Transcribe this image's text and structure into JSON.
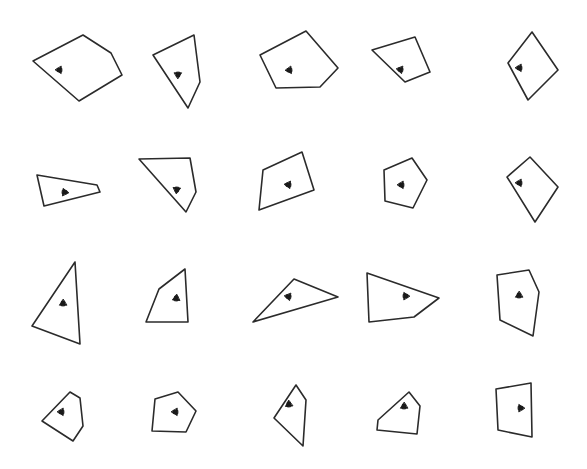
{
  "figure": {
    "background_color": "#ffffff",
    "stroke_color": "#2b2b2b",
    "marker_color": "#1a1a1a",
    "width": 587,
    "height": 469,
    "grid_rows": 4,
    "grid_columns": 5,
    "shape_count": 20
  },
  "chart_data": {
    "type": "scatter",
    "xlabel": "",
    "ylabel": "",
    "xlim": [
      0,
      587
    ],
    "ylim": [
      0,
      469
    ],
    "grid": false,
    "legend": null,
    "shapes": [
      {
        "id": "shape-r1c1",
        "row": 1,
        "column": 1,
        "sides": 5,
        "kind": "pentagon",
        "marker_direction": "left",
        "marker_angle_deg": 180,
        "marker_point": [
          61,
          70
        ],
        "vertices": [
          [
            33,
            61
          ],
          [
            83,
            35
          ],
          [
            111,
            53
          ],
          [
            122,
            75
          ],
          [
            79,
            101
          ]
        ]
      },
      {
        "id": "shape-r1c2",
        "row": 1,
        "column": 2,
        "sides": 4,
        "kind": "quadrilateral",
        "marker_direction": "down",
        "marker_angle_deg": 90,
        "marker_point": [
          178,
          73
        ],
        "vertices": [
          [
            153,
            55
          ],
          [
            194,
            35
          ],
          [
            200,
            82
          ],
          [
            188,
            108
          ]
        ]
      },
      {
        "id": "shape-r1c3",
        "row": 1,
        "column": 3,
        "sides": 5,
        "kind": "pentagon",
        "marker_direction": "left",
        "marker_angle_deg": 175,
        "marker_point": [
          291,
          70
        ],
        "vertices": [
          [
            260,
            55
          ],
          [
            306,
            31
          ],
          [
            338,
            68
          ],
          [
            320,
            87
          ],
          [
            276,
            88
          ]
        ]
      },
      {
        "id": "shape-r1c4",
        "row": 1,
        "column": 4,
        "sides": 4,
        "kind": "quadrilateral",
        "marker_direction": "left",
        "marker_angle_deg": 190,
        "marker_point": [
          402,
          70
        ],
        "vertices": [
          [
            372,
            50
          ],
          [
            415,
            37
          ],
          [
            430,
            72
          ],
          [
            405,
            82
          ]
        ]
      },
      {
        "id": "shape-r1c5",
        "row": 1,
        "column": 5,
        "sides": 4,
        "kind": "quadrilateral",
        "marker_direction": "left",
        "marker_angle_deg": 180,
        "marker_point": [
          521,
          68
        ],
        "vertices": [
          [
            508,
            63
          ],
          [
            532,
            32
          ],
          [
            558,
            70
          ],
          [
            528,
            100
          ]
        ]
      },
      {
        "id": "shape-r2c1",
        "row": 2,
        "column": 1,
        "sides": 4,
        "kind": "quadrilateral",
        "marker_direction": "right",
        "marker_angle_deg": 5,
        "marker_point": [
          63,
          192
        ],
        "vertices": [
          [
            37,
            175
          ],
          [
            97,
            185
          ],
          [
            100,
            192
          ],
          [
            44,
            206
          ]
        ]
      },
      {
        "id": "shape-r2c2",
        "row": 2,
        "column": 2,
        "sides": 4,
        "kind": "quadrilateral",
        "marker_direction": "down",
        "marker_angle_deg": 95,
        "marker_point": [
          177,
          188
        ],
        "vertices": [
          [
            139,
            159
          ],
          [
            190,
            158
          ],
          [
            196,
            192
          ],
          [
            186,
            212
          ]
        ]
      },
      {
        "id": "shape-r2c3",
        "row": 2,
        "column": 3,
        "sides": 4,
        "kind": "quadrilateral",
        "marker_direction": "left",
        "marker_angle_deg": 185,
        "marker_point": [
          290,
          185
        ],
        "vertices": [
          [
            263,
            170
          ],
          [
            302,
            152
          ],
          [
            314,
            190
          ],
          [
            259,
            210
          ]
        ]
      },
      {
        "id": "shape-r2c4",
        "row": 2,
        "column": 4,
        "sides": 5,
        "kind": "pentagon",
        "marker_direction": "left",
        "marker_angle_deg": 180,
        "marker_point": [
          403,
          185
        ],
        "vertices": [
          [
            384,
            170
          ],
          [
            412,
            158
          ],
          [
            427,
            180
          ],
          [
            413,
            208
          ],
          [
            385,
            201
          ]
        ]
      },
      {
        "id": "shape-r2c5",
        "row": 2,
        "column": 5,
        "sides": 4,
        "kind": "quadrilateral",
        "marker_direction": "left",
        "marker_angle_deg": 180,
        "marker_point": [
          521,
          183
        ],
        "vertices": [
          [
            507,
            177
          ],
          [
            530,
            157
          ],
          [
            558,
            187
          ],
          [
            535,
            222
          ]
        ]
      },
      {
        "id": "shape-r3c1",
        "row": 3,
        "column": 1,
        "sides": 3,
        "kind": "triangle",
        "marker_direction": "up",
        "marker_angle_deg": 270,
        "marker_point": [
          63,
          305
        ],
        "vertices": [
          [
            75,
            262
          ],
          [
            80,
            344
          ],
          [
            32,
            326
          ]
        ]
      },
      {
        "id": "shape-r3c2",
        "row": 3,
        "column": 2,
        "sides": 4,
        "kind": "quadrilateral",
        "marker_direction": "up",
        "marker_angle_deg": 275,
        "marker_point": [
          176,
          300
        ],
        "vertices": [
          [
            185,
            269
          ],
          [
            188,
            322
          ],
          [
            146,
            322
          ],
          [
            159,
            289
          ]
        ]
      },
      {
        "id": "shape-r3c3",
        "row": 3,
        "column": 3,
        "sides": 3,
        "kind": "triangle",
        "marker_direction": "left",
        "marker_angle_deg": 190,
        "marker_point": [
          290,
          297
        ],
        "vertices": [
          [
            294,
            279
          ],
          [
            338,
            297
          ],
          [
            253,
            322
          ]
        ]
      },
      {
        "id": "shape-r3c4",
        "row": 3,
        "column": 4,
        "sides": 4,
        "kind": "quadrilateral",
        "marker_direction": "right",
        "marker_angle_deg": 0,
        "marker_point": [
          404,
          296
        ],
        "vertices": [
          [
            367,
            273
          ],
          [
            439,
            298
          ],
          [
            414,
            317
          ],
          [
            369,
            322
          ]
        ]
      },
      {
        "id": "shape-r3c5",
        "row": 3,
        "column": 5,
        "sides": 5,
        "kind": "pentagon",
        "marker_direction": "up",
        "marker_angle_deg": 270,
        "marker_point": [
          519,
          297
        ],
        "vertices": [
          [
            497,
            275
          ],
          [
            529,
            270
          ],
          [
            539,
            292
          ],
          [
            533,
            336
          ],
          [
            500,
            320
          ]
        ]
      },
      {
        "id": "shape-r4c1",
        "row": 4,
        "column": 1,
        "sides": 5,
        "kind": "pentagon",
        "marker_direction": "left",
        "marker_angle_deg": 180,
        "marker_point": [
          63,
          412
        ],
        "vertices": [
          [
            70,
            392
          ],
          [
            80,
            398
          ],
          [
            83,
            426
          ],
          [
            73,
            441
          ],
          [
            42,
            421
          ]
        ]
      },
      {
        "id": "shape-r4c2",
        "row": 4,
        "column": 2,
        "sides": 5,
        "kind": "pentagon",
        "marker_direction": "left",
        "marker_angle_deg": 180,
        "marker_point": [
          177,
          412
        ],
        "vertices": [
          [
            155,
            399
          ],
          [
            178,
            392
          ],
          [
            196,
            411
          ],
          [
            186,
            432
          ],
          [
            152,
            431
          ]
        ]
      },
      {
        "id": "shape-r4c3",
        "row": 4,
        "column": 3,
        "sides": 4,
        "kind": "quadrilateral",
        "marker_direction": "up",
        "marker_angle_deg": 265,
        "marker_point": [
          289,
          406
        ],
        "vertices": [
          [
            296,
            385
          ],
          [
            306,
            400
          ],
          [
            303,
            446
          ],
          [
            274,
            418
          ]
        ]
      },
      {
        "id": "shape-r4c4",
        "row": 4,
        "column": 4,
        "sides": 5,
        "kind": "pentagon",
        "marker_direction": "up",
        "marker_angle_deg": 270,
        "marker_point": [
          404,
          408
        ],
        "vertices": [
          [
            409,
            392
          ],
          [
            420,
            406
          ],
          [
            417,
            434
          ],
          [
            377,
            430
          ],
          [
            378,
            420
          ]
        ]
      },
      {
        "id": "shape-r4c5",
        "row": 4,
        "column": 5,
        "sides": 4,
        "kind": "quadrilateral",
        "marker_direction": "right",
        "marker_angle_deg": 0,
        "marker_point": [
          519,
          408
        ],
        "vertices": [
          [
            496,
            389
          ],
          [
            531,
            383
          ],
          [
            532,
            437
          ],
          [
            498,
            430
          ]
        ]
      }
    ]
  }
}
